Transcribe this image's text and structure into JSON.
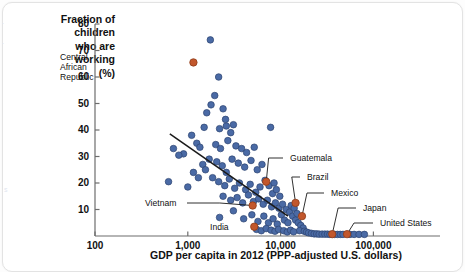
{
  "figure": {
    "y_axis_title": "Fraction of\nchildren\nwho are\nworking\n(%)",
    "x_axis_title": "GDP per capita in 2012 (PPP-adjusted U.S. dollars)"
  },
  "colors": {
    "point_blue": "#4a6aa5",
    "point_blue_edge": "#2d4470",
    "point_orange": "#c2572c",
    "point_orange_edge": "#8e3b18",
    "axis": "#6d6d6d",
    "trendline": "#1a1a1a",
    "text": "#111111",
    "background": "#ffffff"
  },
  "chart_data": {
    "type": "scatter",
    "title": "",
    "xlabel": "GDP per capita in 2012 (PPP-adjusted U.S. dollars)",
    "ylabel": "Fraction of children who are working (%)",
    "xscale": "log",
    "yscale": "linear",
    "xlim": [
      100,
      150000
    ],
    "ylim": [
      0,
      84
    ],
    "grid": false,
    "legend": "none",
    "xticks": [
      {
        "value": 100,
        "label": "100"
      },
      {
        "value": 1000,
        "label": "1,000"
      },
      {
        "value": 10000,
        "label": "10,000"
      },
      {
        "value": 100000,
        "label": "100,000"
      }
    ],
    "yticks": [
      {
        "value": 10,
        "label": "10"
      },
      {
        "value": 20,
        "label": "20"
      },
      {
        "value": 30,
        "label": "30"
      },
      {
        "value": 40,
        "label": "40"
      },
      {
        "value": 50,
        "label": "50"
      },
      {
        "value": 60,
        "label": "60"
      },
      {
        "value": 70,
        "label": "70"
      },
      {
        "value": 80,
        "label": "80"
      }
    ],
    "trendline": {
      "x_start": 640,
      "y_start": 38.5,
      "x_end": 12000,
      "y_end": 7.5
    },
    "highlighted_points": [
      {
        "name": "Central African Republic",
        "x": 1150,
        "y": 65.5,
        "label_x": 115,
        "label_y": 52,
        "label_align": "right",
        "leader": false
      },
      {
        "name": "Guatemala",
        "x": 7000,
        "y": 20.5,
        "label_x": 290,
        "label_y": 153,
        "leader": true
      },
      {
        "name": "Brazil",
        "x": 14500,
        "y": 12.5,
        "label_x": 307,
        "label_y": 172,
        "leader": true
      },
      {
        "name": "Mexico",
        "x": 17000,
        "y": 7.5,
        "label_x": 331,
        "label_y": 188,
        "leader": true
      },
      {
        "name": "Japan",
        "x": 36000,
        "y": 0.7,
        "label_x": 363,
        "label_y": 203,
        "leader": true
      },
      {
        "name": "United States",
        "x": 52000,
        "y": 0.7,
        "label_x": 380,
        "label_y": 218,
        "leader": true
      },
      {
        "name": "Vietnam",
        "x": 5000,
        "y": 11.5,
        "label_x": 145,
        "label_y": 198,
        "label_align": "left",
        "leader": true
      },
      {
        "name": "India",
        "x": 5200,
        "y": 3.5,
        "label_x": 210,
        "label_y": 222,
        "label_align": "left",
        "leader": false
      }
    ],
    "series": [
      {
        "name": "countries",
        "points": [
          [
            1750,
            74.0
          ],
          [
            2150,
            60.0
          ],
          [
            1950,
            53.0
          ],
          [
            1780,
            49.5
          ],
          [
            1600,
            46.5
          ],
          [
            2400,
            48.0
          ],
          [
            2550,
            44.0
          ],
          [
            2600,
            41.5
          ],
          [
            2200,
            40.5
          ],
          [
            1500,
            41.0
          ],
          [
            1100,
            38.0
          ],
          [
            2900,
            39.0
          ],
          [
            3100,
            42.0
          ],
          [
            7800,
            41.0
          ],
          [
            1250,
            35.0
          ],
          [
            900,
            31.0
          ],
          [
            1350,
            33.5
          ],
          [
            2000,
            34.5
          ],
          [
            2250,
            33.0
          ],
          [
            2700,
            36.0
          ],
          [
            3300,
            34.0
          ],
          [
            3800,
            33.0
          ],
          [
            4300,
            31.5
          ],
          [
            5200,
            33.5
          ],
          [
            1700,
            29.0
          ],
          [
            1450,
            27.0
          ],
          [
            1550,
            25.0
          ],
          [
            2050,
            28.0
          ],
          [
            2350,
            26.5
          ],
          [
            2600,
            24.0
          ],
          [
            3000,
            29.0
          ],
          [
            3500,
            27.5
          ],
          [
            4100,
            26.0
          ],
          [
            4800,
            28.5
          ],
          [
            5600,
            25.0
          ],
          [
            6300,
            27.0
          ],
          [
            620,
            20.5
          ],
          [
            1000,
            18.5
          ],
          [
            1850,
            22.0
          ],
          [
            2150,
            20.5
          ],
          [
            2500,
            19.0
          ],
          [
            2800,
            21.5
          ],
          [
            3200,
            18.0
          ],
          [
            3600,
            20.0
          ],
          [
            4200,
            17.5
          ],
          [
            4700,
            19.5
          ],
          [
            5400,
            16.5
          ],
          [
            6000,
            18.5
          ],
          [
            6800,
            21.0
          ],
          [
            7500,
            19.0
          ],
          [
            8200,
            16.0
          ],
          [
            9000,
            17.5
          ],
          [
            2400,
            15.0
          ],
          [
            2900,
            13.5
          ],
          [
            3400,
            14.5
          ],
          [
            3900,
            12.5
          ],
          [
            4500,
            15.5
          ],
          [
            5100,
            13.0
          ],
          [
            5800,
            14.0
          ],
          [
            6500,
            12.0
          ],
          [
            7200,
            13.5
          ],
          [
            8000,
            11.0
          ],
          [
            8800,
            12.5
          ],
          [
            9600,
            10.5
          ],
          [
            2200,
            7.0
          ],
          [
            3100,
            9.5
          ],
          [
            4000,
            6.5
          ],
          [
            4900,
            8.0
          ],
          [
            5700,
            5.5
          ],
          [
            6600,
            7.5
          ],
          [
            7400,
            5.0
          ],
          [
            8300,
            6.5
          ],
          [
            9200,
            4.5
          ],
          [
            10200,
            8.0
          ],
          [
            11000,
            6.0
          ],
          [
            12000,
            5.0
          ],
          [
            10500,
            12.0
          ],
          [
            11500,
            10.0
          ],
          [
            12500,
            9.0
          ],
          [
            13500,
            7.5
          ],
          [
            14500,
            6.0
          ],
          [
            15500,
            5.0
          ],
          [
            16500,
            4.0
          ],
          [
            17500,
            3.0
          ],
          [
            13000,
            11.5
          ],
          [
            14000,
            10.5
          ],
          [
            15000,
            8.5
          ],
          [
            16000,
            2.0
          ],
          [
            18000,
            1.8
          ],
          [
            19000,
            1.5
          ],
          [
            20000,
            1.2
          ],
          [
            21500,
            1.0
          ],
          [
            23000,
            0.8
          ],
          [
            24500,
            0.8
          ],
          [
            26000,
            0.7
          ],
          [
            28000,
            0.7
          ],
          [
            30000,
            0.7
          ],
          [
            32000,
            0.7
          ],
          [
            34000,
            0.6
          ],
          [
            38000,
            0.6
          ],
          [
            41000,
            0.6
          ],
          [
            44000,
            0.6
          ],
          [
            47000,
            0.6
          ],
          [
            56000,
            0.6
          ],
          [
            62000,
            0.6
          ],
          [
            70000,
            0.6
          ],
          [
            80000,
            0.6
          ],
          [
            5500,
            2.5
          ],
          [
            6200,
            2.0
          ],
          [
            7000,
            2.8
          ],
          [
            7900,
            2.2
          ],
          [
            8700,
            1.8
          ],
          [
            9500,
            2.5
          ],
          [
            10800,
            2.0
          ],
          [
            11800,
            1.5
          ],
          [
            12800,
            2.2
          ],
          [
            13800,
            1.6
          ],
          [
            8500,
            20.0
          ],
          [
            9800,
            15.0
          ],
          [
            1150,
            24.0
          ],
          [
            1300,
            22.0
          ],
          [
            700,
            33.0
          ],
          [
            800,
            30.5
          ]
        ]
      }
    ]
  }
}
